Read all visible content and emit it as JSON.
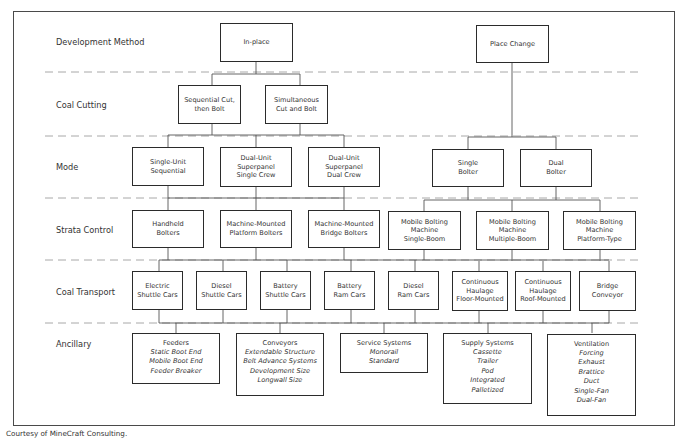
{
  "diagram": {
    "row_labels": [
      "Development Method",
      "Coal Cutting",
      "Mode",
      "Strata Control",
      "Coal Transport",
      "Ancillary"
    ],
    "development_method": [
      {
        "lines": [
          "In-place"
        ]
      },
      {
        "lines": [
          "Place Change"
        ]
      }
    ],
    "coal_cutting": [
      {
        "lines": [
          "Sequential Cut,",
          "then Bolt"
        ]
      },
      {
        "lines": [
          "Simultaneous",
          "Cut and Bolt"
        ]
      }
    ],
    "mode": [
      {
        "lines": [
          "Single-Unit",
          "Sequential"
        ]
      },
      {
        "lines": [
          "Dual-Unit",
          "Superpanel",
          "Single Crew"
        ]
      },
      {
        "lines": [
          "Dual-Unit",
          "Superpanel",
          "Dual Crew"
        ]
      },
      {
        "lines": [
          "Single",
          "Bolter"
        ]
      },
      {
        "lines": [
          "Dual",
          "Bolter"
        ]
      }
    ],
    "strata_control": [
      {
        "lines": [
          "Handheld",
          "Bolters"
        ]
      },
      {
        "lines": [
          "Machine-Mounted",
          "Platform Bolters"
        ]
      },
      {
        "lines": [
          "Machine-Mounted",
          "Bridge Bolters"
        ]
      },
      {
        "lines": [
          "Mobile Bolting",
          "Machine",
          "Single-Boom"
        ]
      },
      {
        "lines": [
          "Mobile Bolting",
          "Machine",
          "Multiple-Boom"
        ]
      },
      {
        "lines": [
          "Mobile Bolting",
          "Machine",
          "Platform-Type"
        ]
      }
    ],
    "coal_transport": [
      {
        "lines": [
          "Electric",
          "Shuttle Cars"
        ]
      },
      {
        "lines": [
          "Diesel",
          "Shuttle Cars"
        ]
      },
      {
        "lines": [
          "Battery",
          "Shuttle Cars"
        ]
      },
      {
        "lines": [
          "Battery",
          "Ram Cars"
        ]
      },
      {
        "lines": [
          "Diesel",
          "Ram Cars"
        ]
      },
      {
        "lines": [
          "Continuous",
          "Haulage",
          "Floor-Mounted"
        ]
      },
      {
        "lines": [
          "Continuous",
          "Haulage",
          "Roof-Mounted"
        ]
      },
      {
        "lines": [
          "Bridge",
          "Conveyor"
        ]
      }
    ],
    "ancillary": [
      {
        "heading": "Feeders",
        "items": [
          "Static Boot End",
          "Mobile Boot End",
          "Feeder Breaker"
        ]
      },
      {
        "heading": "Conveyors",
        "items": [
          "Extendable Structure",
          "Belt Advance Systems",
          "Development Size",
          "Longwall Size"
        ]
      },
      {
        "heading": "Service Systems",
        "items": [
          "Monorail",
          "Standard"
        ]
      },
      {
        "heading": "Supply Systems",
        "items": [
          "Cassette",
          "Trailer",
          "Pod",
          "Integrated",
          "Palletized"
        ]
      },
      {
        "heading": "Ventilation",
        "items": [
          "Forcing",
          "Exhaust",
          "Brattice",
          "Duct",
          "Single-Fan",
          "Dual-Fan"
        ]
      }
    ]
  },
  "credit": "Courtesy of MineCraft Consulting."
}
